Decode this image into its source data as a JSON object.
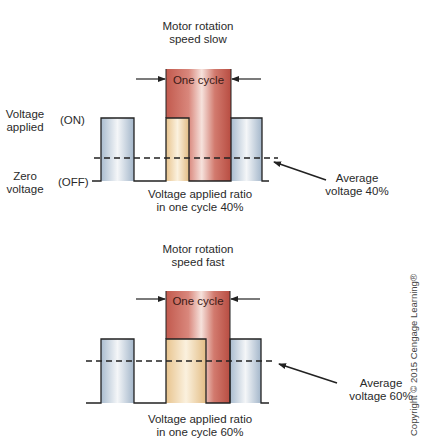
{
  "diagrams": [
    {
      "title_line1": "Motor rotation",
      "title_line2": "speed slow",
      "cycle_label": "One cycle",
      "y_labels": {
        "on_line1": "Voltage",
        "on_line2": "applied",
        "on_state": "(ON)",
        "off_line1": "Zero",
        "off_line2": "voltage",
        "off_state": "(OFF)"
      },
      "ratio_line1": "Voltage applied ratio",
      "ratio_line2": "in one cycle 40%",
      "average_line1": "Average",
      "average_line2": "voltage 40%",
      "duty_cycle_percent": 40
    },
    {
      "title_line1": "Motor rotation",
      "title_line2": "speed fast",
      "cycle_label": "One cycle",
      "ratio_line1": "Voltage applied ratio",
      "ratio_line2": "in one cycle 60%",
      "average_line1": "Average",
      "average_line2": "voltage 60%",
      "duty_cycle_percent": 60
    }
  ],
  "copyright": "Copyright © 2015 Cengage Learning®",
  "colors": {
    "pulse_blue": "#c9d6e3",
    "pulse_yellow": "#f0d9a8",
    "cycle_red": "#c8655a",
    "line": "#222222"
  }
}
